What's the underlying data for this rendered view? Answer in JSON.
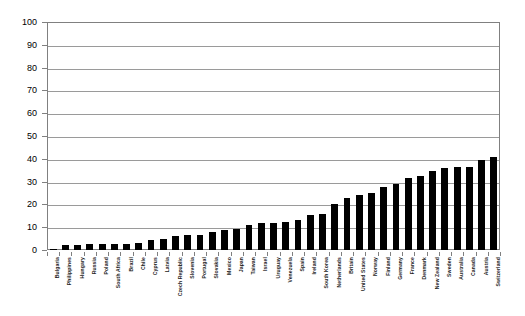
{
  "chart_data": {
    "type": "bar",
    "title": "",
    "subtitle": "",
    "xlabel": "",
    "ylabel": "",
    "ylim": [
      0,
      100
    ],
    "y_ticks": [
      0,
      10,
      20,
      30,
      40,
      50,
      60,
      70,
      80,
      90,
      100
    ],
    "y_tick_labels": [
      "0",
      "10",
      "20",
      "30",
      "40",
      "50",
      "60",
      "70",
      "80",
      "90",
      "100"
    ],
    "grid": true,
    "legend": false,
    "legend_position": "none",
    "bar_color": "#000000",
    "categories": [
      "Bulgaria",
      "Philippines",
      "Hungary",
      "Russia",
      "Poland",
      "South Africa",
      "Brazil",
      "Chile",
      "Cyprus",
      "Latvia",
      "Czech Republic",
      "Slovenia",
      "Portugal",
      "Slovakia",
      "Mexico",
      "Japan",
      "Taiwan",
      "Israel",
      "Uruguay",
      "Venezuela",
      "Spain",
      "Ireland",
      "South Korea",
      "Netherlands",
      "Britain",
      "United States",
      "Norway",
      "Finland",
      "Germany",
      "France",
      "Denmark",
      "New Zealand",
      "Sweden",
      "Australia",
      "Canada",
      "Austria",
      "Switzerland"
    ],
    "values": [
      0.5,
      2.2,
      2.3,
      2.6,
      2.6,
      2.6,
      2.8,
      3.2,
      4.5,
      4.9,
      6.2,
      6.6,
      6.8,
      7.8,
      8.6,
      9.1,
      11.1,
      11.9,
      12.0,
      12.2,
      13.2,
      15.2,
      16.0,
      20.4,
      22.7,
      24.1,
      25.0,
      27.5,
      29.0,
      31.8,
      32.5,
      34.8,
      36.0,
      36.2,
      36.2,
      39.5,
      41.0
    ]
  }
}
